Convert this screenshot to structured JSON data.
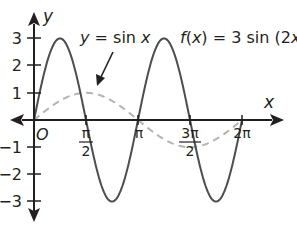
{
  "chart_data": {
    "type": "line",
    "title": "",
    "xlabel": "x",
    "ylabel": "y",
    "origin_label": "O",
    "xlim": [
      0,
      6.2832
    ],
    "ylim": [
      -3,
      3
    ],
    "grid": false,
    "x_ticks": [
      {
        "value": 1.5708,
        "label_num": "π",
        "label_den": "2"
      },
      {
        "value": 3.1416,
        "label": "π"
      },
      {
        "value": 4.7124,
        "label_num": "3π",
        "label_den": "2"
      },
      {
        "value": 6.2832,
        "label": "2π"
      }
    ],
    "y_ticks": [
      {
        "value": 3,
        "label": "3"
      },
      {
        "value": 2,
        "label": "2"
      },
      {
        "value": 1,
        "label": "1"
      },
      {
        "value": -1,
        "label": "−1"
      },
      {
        "value": -2,
        "label": "−2"
      },
      {
        "value": -3,
        "label": "−3"
      }
    ],
    "series": [
      {
        "name": "f(x) = 3 sin (2x)",
        "style": "solid",
        "color": "#4d4d4d",
        "x": [
          0,
          0.7854,
          1.5708,
          2.3562,
          3.1416,
          3.927,
          4.7124,
          5.4978,
          6.2832
        ],
        "y": [
          0,
          3,
          0,
          -3,
          0,
          3,
          0,
          -3,
          0
        ]
      },
      {
        "name": "y = sin x",
        "style": "dashed",
        "color": "#b3b3b3",
        "x": [
          0,
          1.5708,
          3.1416,
          4.7124,
          6.2832
        ],
        "y": [
          0,
          1,
          0,
          -1,
          0
        ]
      }
    ],
    "annotations": [
      {
        "text": "y = sin x",
        "points_to": "sin x curve near (π/2, 1)"
      },
      {
        "text": "f(x) = 3 sin (2x)",
        "position": "top right"
      }
    ]
  },
  "labels": {
    "y_axis": "y",
    "x_axis": "x",
    "origin": "O",
    "sin_label_y": "y",
    "sin_label_rest": " = sin ",
    "sin_label_x": "x",
    "f_label_f": "f",
    "f_label_open": "(",
    "f_label_x": "x",
    "f_label_mid": ") = 3 sin (2",
    "f_label_x2": "x",
    "f_label_close": ")",
    "ytick_3": "3",
    "ytick_2": "2",
    "ytick_1": "1",
    "ytick_m1": "−1",
    "ytick_m2": "−2",
    "ytick_m3": "−3",
    "xtick_pi2_num": "π",
    "xtick_pi2_den": "2",
    "xtick_pi": "π",
    "xtick_3pi2_num": "3π",
    "xtick_3pi2_den": "2",
    "xtick_2pi": "2π"
  }
}
